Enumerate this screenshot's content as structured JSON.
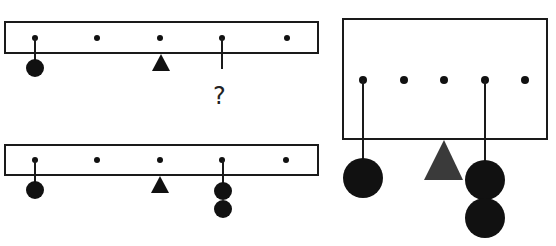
{
  "colors": {
    "stroke": "#1a1a1a",
    "fill": "#111111",
    "fulcrum_large": "#3a3a3a",
    "background": "#ffffff"
  },
  "panels": [
    {
      "id": "top-left",
      "description": "Beam with 5 hooks; 1 weight on hook 1, fulcrum at hook 3, unknown on hook 4",
      "hooks": 5,
      "fulcrum_position": 3,
      "weights": [
        {
          "hook": 1,
          "count": 1
        }
      ],
      "unknown": {
        "hook": 4,
        "label": "?"
      }
    },
    {
      "id": "bottom-left",
      "description": "Beam with 5 hooks; 1 weight on hook 1, fulcrum at hook 3, 2 weights on hook 4",
      "hooks": 5,
      "fulcrum_position": 3,
      "weights": [
        {
          "hook": 1,
          "count": 1
        },
        {
          "hook": 4,
          "count": 2
        }
      ]
    },
    {
      "id": "right",
      "description": "Enlarged view: 1 weight on hook 1, fulcrum at hook 3, 2 weights on hook 4",
      "hooks": 5,
      "fulcrum_position": 3,
      "weights": [
        {
          "hook": 1,
          "count": 1
        },
        {
          "hook": 4,
          "count": 2
        }
      ]
    }
  ],
  "question_mark": "?"
}
